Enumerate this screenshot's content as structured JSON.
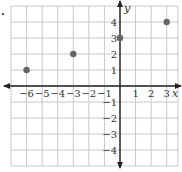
{
  "chart_data": {
    "type": "scatter",
    "title": "",
    "xlabel": "x",
    "ylabel": "y",
    "xlim": [
      -7,
      3.75
    ],
    "ylim": [
      -5,
      5
    ],
    "grid": true,
    "x_tick_labels": [
      "−6",
      "−5",
      "−4",
      "−3",
      "−2",
      "−1",
      "1",
      "2",
      "3"
    ],
    "x_ticks": [
      -6,
      -5,
      -4,
      -3,
      -2,
      -1,
      1,
      2,
      3
    ],
    "y_tick_labels": [
      "4",
      "3",
      "2",
      "1",
      "−1",
      "−2",
      "−3",
      "−4"
    ],
    "y_ticks": [
      4,
      3,
      2,
      1,
      -1,
      -2,
      -3,
      -4
    ],
    "series": [
      {
        "name": "points",
        "points": [
          {
            "x": -6,
            "y": 1
          },
          {
            "x": -3,
            "y": 2
          },
          {
            "x": 0,
            "y": 3
          },
          {
            "x": 3,
            "y": 4
          }
        ]
      }
    ],
    "colors": {
      "grid": "#c8c8c8",
      "axis": "#222222",
      "point": "#666666"
    }
  },
  "labels": {
    "x_axis": "x",
    "y_axis": "y"
  }
}
